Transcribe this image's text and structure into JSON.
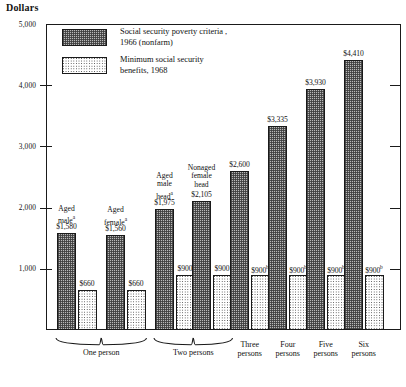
{
  "axis_title": "Dollars",
  "legend": {
    "items": [
      {
        "swatch": "dark",
        "line1": "Social security poverty criteria ,",
        "line2": "1966 (nonfarm)"
      },
      {
        "swatch": "light",
        "line1": "Minimum social security",
        "line2": "benefits, 1968"
      }
    ]
  },
  "yticks": [
    {
      "label": "5,000",
      "value": 5000
    },
    {
      "label": "4,000",
      "value": 4000
    },
    {
      "label": "3,000",
      "value": 3000
    },
    {
      "label": "2,000",
      "value": 2000
    },
    {
      "label": "1,000",
      "value": 1000
    }
  ],
  "groups": [
    {
      "caption_lines": [
        "Aged",
        "maleᵃ"
      ],
      "poverty_label": "$1,580",
      "benefit_label": "$660",
      "benefit_sup": ""
    },
    {
      "caption_lines": [
        "Aged",
        "femaleᵃ"
      ],
      "poverty_label": "$1,560",
      "benefit_label": "$660",
      "benefit_sup": ""
    },
    {
      "caption_lines": [
        "Aged",
        "male",
        "headᵃ"
      ],
      "poverty_label": "$1,975",
      "benefit_label": "$900",
      "benefit_sup": ""
    },
    {
      "caption_lines": [
        "Nonaged",
        "female",
        "head"
      ],
      "poverty_label": "$2,105",
      "benefit_label": "$900",
      "benefit_sup": ""
    },
    {
      "caption_lines": [],
      "poverty_label": "$2,600",
      "benefit_label": "$900",
      "benefit_sup": "b"
    },
    {
      "caption_lines": [],
      "poverty_label": "$3,335",
      "benefit_label": "$900",
      "benefit_sup": "b"
    },
    {
      "caption_lines": [],
      "poverty_label": "$3,930",
      "benefit_label": "$900",
      "benefit_sup": "b"
    },
    {
      "caption_lines": [],
      "poverty_label": "$4,410",
      "benefit_label": "$900",
      "benefit_sup": "b"
    }
  ],
  "xcategories": [
    {
      "lines": [
        "One person"
      ],
      "brace": true
    },
    {
      "lines": [
        "Two persons"
      ],
      "brace": true
    },
    {
      "lines": [
        "Three",
        "persons"
      ],
      "brace": false
    },
    {
      "lines": [
        "Four",
        "persons"
      ],
      "brace": false
    },
    {
      "lines": [
        "Five",
        "persons"
      ],
      "brace": false
    },
    {
      "lines": [
        "Six",
        "persons"
      ],
      "brace": false
    }
  ],
  "chart_data": {
    "type": "bar",
    "title": "",
    "subtitle": "",
    "xlabel": "",
    "ylabel": "Dollars",
    "ylim": [
      0,
      5000
    ],
    "ytick_values": [
      1000,
      2000,
      3000,
      4000,
      5000
    ],
    "grid": false,
    "legend_position": "inside-top-left",
    "categories": [
      "Aged male (one person)",
      "Aged female (one person)",
      "Aged male head (two persons)",
      "Nonaged female head (two persons)",
      "Three persons",
      "Four persons",
      "Five persons",
      "Six persons"
    ],
    "series": [
      {
        "name": "Social security poverty criteria , 1966 (nonfarm)",
        "values": [
          1580,
          1560,
          1975,
          2105,
          2600,
          3335,
          3930,
          4410
        ],
        "pattern": "dark-hatch"
      },
      {
        "name": "Minimum social security benefits, 1968",
        "values": [
          660,
          660,
          900,
          900,
          900,
          900,
          900,
          900
        ],
        "pattern": "light-dot"
      }
    ],
    "annotations": [
      "a = superscript on 'Aged male', 'Aged female', 'Aged male head'",
      "b = superscript on $900 for three, four, five and six persons"
    ],
    "group_brackets": [
      {
        "label": "One person",
        "categories": [
          0,
          1
        ]
      },
      {
        "label": "Two persons",
        "categories": [
          2,
          3
        ]
      },
      {
        "label": "Three persons",
        "categories": [
          4
        ]
      },
      {
        "label": "Four persons",
        "categories": [
          5
        ]
      },
      {
        "label": "Five persons",
        "categories": [
          6
        ]
      },
      {
        "label": "Six persons",
        "categories": [
          7
        ]
      }
    ]
  }
}
